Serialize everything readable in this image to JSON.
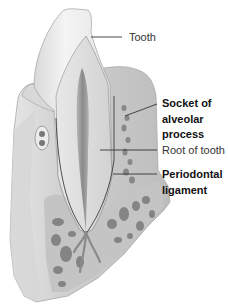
{
  "figure": {
    "colors": {
      "background": "#ffffff",
      "enamel": "#efefef",
      "dentin": "#dcdcdc",
      "pulp": "#9a9a9a",
      "bone_outer": "#c8c8c8",
      "bone_spongy": "#bdbdbd",
      "bone_holes": "#6e6e6e",
      "leader_line": "#333333",
      "label_text": "#1a1a1a"
    }
  },
  "labels": [
    {
      "id": "tooth",
      "lines": [
        "Tooth"
      ],
      "weight": "regular"
    },
    {
      "id": "socket",
      "lines": [
        "Socket of",
        "alveolar",
        "process"
      ],
      "weight": "bold"
    },
    {
      "id": "root",
      "lines": [
        "Root of tooth"
      ],
      "weight": "regular"
    },
    {
      "id": "periodontal",
      "lines": [
        "Periodontal",
        "ligament"
      ],
      "weight": "bold"
    }
  ]
}
